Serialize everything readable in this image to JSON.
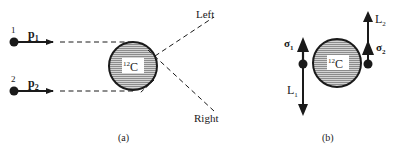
{
  "diagram": {
    "panel_a": {
      "caption": "(a)",
      "particle_1": {
        "number": "1",
        "momentum_label": "p",
        "momentum_sub": "1"
      },
      "particle_2": {
        "number": "2",
        "momentum_label": "p",
        "momentum_sub": "2"
      },
      "nucleus": {
        "mass_number": "12",
        "symbol": "C"
      },
      "direction_left": "Left",
      "direction_right": "Right"
    },
    "panel_b": {
      "caption": "(b)",
      "nucleus": {
        "mass_number": "12",
        "symbol": "C"
      },
      "spin_1": {
        "symbol": "σ",
        "sub": "1"
      },
      "spin_2": {
        "symbol": "σ",
        "sub": "2"
      },
      "ang_mom_1": {
        "symbol": "L",
        "sub": "1"
      },
      "ang_mom_2": {
        "symbol": "L",
        "sub": "2"
      }
    },
    "colors": {
      "ink": "#1a1a1a",
      "hatch": "#8a8a8a",
      "fill": "#c8c8c8"
    }
  }
}
